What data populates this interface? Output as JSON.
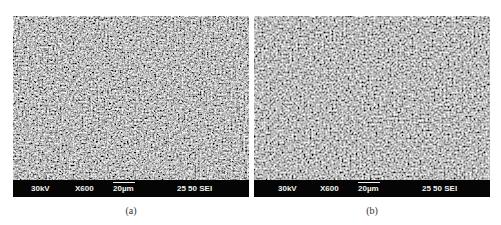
{
  "figure": {
    "panels": [
      {
        "id": "a",
        "caption": "(a)",
        "infobar": {
          "voltage": "30kV",
          "magnification": "X600",
          "scale_label": "20µm",
          "detector": "25 50 SEI"
        }
      },
      {
        "id": "b",
        "caption": "(b)",
        "infobar": {
          "voltage": "30kV",
          "magnification": "X600",
          "scale_label": "20µm",
          "detector": "25 50 SEI"
        }
      }
    ],
    "colors": {
      "infobar_bg": "#050505",
      "infobar_text": "#f2f2f2",
      "texture_mid": "#8a8a8a"
    }
  }
}
